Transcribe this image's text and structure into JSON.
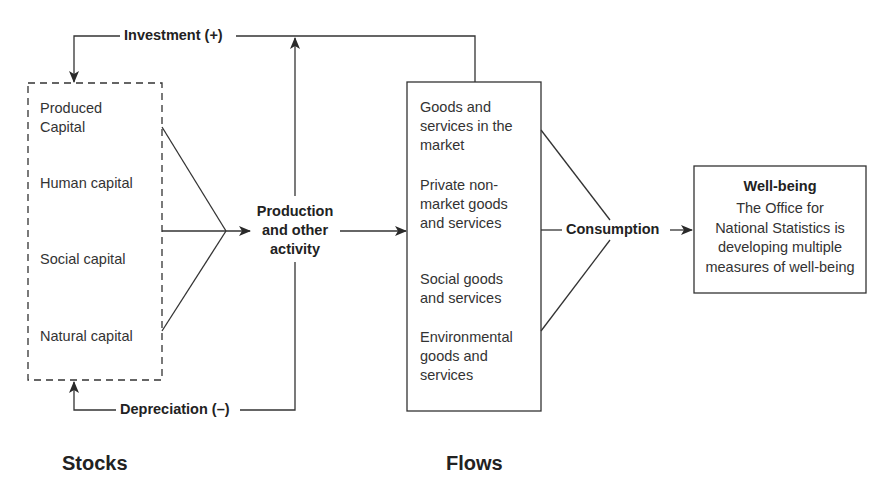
{
  "diagram": {
    "stocks": {
      "title": "Stocks",
      "items": [
        "Produced\nCapital",
        "Human capital",
        "Social capital",
        "Natural capital"
      ],
      "item_lines": [
        [
          "Produced",
          "Capital"
        ],
        [
          "Human capital"
        ],
        [
          "Social capital"
        ],
        [
          "Natural capital"
        ]
      ]
    },
    "production": {
      "lines": [
        "Production",
        "and other",
        "activity"
      ]
    },
    "flows": {
      "title": "Flows",
      "items": [
        [
          "Goods and",
          "services in the",
          "market"
        ],
        [
          "Private non-",
          "market goods",
          "and services"
        ],
        [
          "Social goods",
          "and services"
        ],
        [
          "Environmental",
          "goods and",
          "services"
        ]
      ]
    },
    "consumption": {
      "label": "Consumption"
    },
    "wellbeing": {
      "title": "Well-being",
      "lines": [
        "The Office for",
        "National Statistics is",
        "developing multiple",
        "measures of well-being"
      ]
    },
    "edges": {
      "investment": "Investment (+)",
      "depreciation": "Depreciation (–)"
    },
    "colors": {
      "line": "#333333",
      "text": "#2a2a2a",
      "background": "#ffffff"
    }
  }
}
